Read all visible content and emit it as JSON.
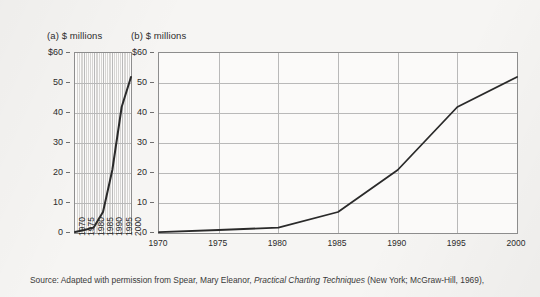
{
  "figure": {
    "background_color": "#f6f5f3",
    "line_color": "#2a2a2a",
    "grid_color": "#b9b9b9",
    "axis_color": "#8d8d8d",
    "caption_parts": {
      "lead": "Source: Adapted with permission from Spear, Mary Eleanor, ",
      "italic_title": "Practical Charting Techniques",
      "tail": " (New York; McGraw-Hill, 1969),"
    }
  },
  "chart_data": [
    {
      "id": "a",
      "type": "line",
      "title": "(a) $ millions",
      "panel_label": "(a)",
      "xlabel": "",
      "ylabel": "$ millions",
      "x": [
        1970,
        1975,
        1980,
        1985,
        1990,
        1995,
        2000
      ],
      "values": [
        0.3,
        1.0,
        1.8,
        7.0,
        21.0,
        42.0,
        52.0
      ],
      "series": [
        {
          "name": "sales",
          "values": [
            0.3,
            1.0,
            1.8,
            7.0,
            21.0,
            42.0,
            52.0
          ]
        }
      ],
      "xticks": [
        "1970",
        "1975",
        "1980",
        "1985",
        "1990",
        "1995",
        "2000"
      ],
      "xtick_rotation": -90,
      "yticks": [
        "$60",
        "50",
        "40",
        "30",
        "20",
        "10",
        "0"
      ],
      "ytick_values": [
        60,
        50,
        40,
        30,
        20,
        10,
        0
      ],
      "ylim": [
        0,
        60
      ],
      "xlim": [
        1970,
        2000
      ],
      "grid": "both",
      "minor_vertical_gridlines": true,
      "legend": "none",
      "note": "narrow horizontal scale makes the rise look steep"
    },
    {
      "id": "b",
      "type": "line",
      "title": "(b) $ millions",
      "panel_label": "(b)",
      "xlabel": "",
      "ylabel": "$ millions",
      "x": [
        1970,
        1975,
        1980,
        1985,
        1990,
        1995,
        2000
      ],
      "values": [
        0.3,
        1.0,
        1.8,
        7.0,
        21.0,
        42.0,
        52.0
      ],
      "series": [
        {
          "name": "sales",
          "values": [
            0.3,
            1.0,
            1.8,
            7.0,
            21.0,
            42.0,
            52.0
          ]
        }
      ],
      "xticks": [
        "1970",
        "1975",
        "1980",
        "1985",
        "1990",
        "1995",
        "2000"
      ],
      "xtick_rotation": 0,
      "yticks": [
        "$60",
        "50",
        "40",
        "30",
        "20",
        "10",
        "0"
      ],
      "ytick_values": [
        60,
        50,
        40,
        30,
        20,
        10,
        0
      ],
      "ylim": [
        0,
        60
      ],
      "xlim": [
        1970,
        2000
      ],
      "grid": "both",
      "minor_vertical_gridlines": false,
      "legend": "none",
      "note": "wide horizontal scale makes the same rise look gradual"
    }
  ]
}
